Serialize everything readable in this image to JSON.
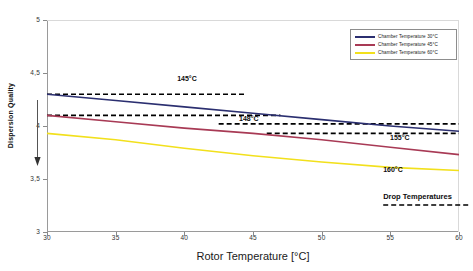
{
  "chart_data": {
    "type": "line",
    "title": "",
    "xlabel": "Rotor Temperature [°C]",
    "ylabel": "Dispersion Quality",
    "xlim": [
      30,
      60
    ],
    "ylim": [
      3,
      5
    ],
    "xticks": [
      "30",
      "35",
      "40",
      "45",
      "50",
      "55",
      "60"
    ],
    "yticks": [
      "5",
      "4,5",
      "4",
      "3,5",
      "3"
    ],
    "grid": false,
    "legend_position": "top-right",
    "series": [
      {
        "name": "Chamber Temperature 30°C",
        "color": "#2b2f70",
        "style": "solid",
        "x": [
          30,
          35,
          40,
          45,
          50,
          55,
          60
        ],
        "values": [
          4.3,
          4.24,
          4.18,
          4.12,
          4.06,
          4.0,
          3.95
        ]
      },
      {
        "name": "Chamber Temperature 45°C",
        "color": "#a83a55",
        "style": "solid",
        "x": [
          30,
          35,
          40,
          45,
          50,
          55,
          60
        ],
        "values": [
          4.1,
          4.04,
          3.98,
          3.93,
          3.87,
          3.8,
          3.73
        ]
      },
      {
        "name": "Chamber Temperature 60°C",
        "color": "#f2e01c",
        "style": "solid",
        "x": [
          30,
          35,
          40,
          45,
          50,
          55,
          60
        ],
        "values": [
          3.93,
          3.87,
          3.79,
          3.72,
          3.66,
          3.61,
          3.58
        ]
      }
    ],
    "reference_lines": [
      {
        "label": "145°C",
        "value": 4.3,
        "style": "dashed",
        "color": "#000000"
      },
      {
        "label": "148°C",
        "value": 4.1,
        "style": "dashed",
        "color": "#000000"
      },
      {
        "label": "155°C",
        "value": 4.02,
        "style": "dashed",
        "color": "#000000"
      },
      {
        "label": "160°C",
        "value": 3.93,
        "style": "dashed",
        "color": "#000000"
      }
    ],
    "annotations": [
      {
        "text": "145°C",
        "x": 40.5,
        "y": 4.43
      },
      {
        "text": "148°C",
        "x": 45.0,
        "y": 4.06
      },
      {
        "text": "155°C",
        "x": 56.0,
        "y": 3.88
      },
      {
        "text": "160°C",
        "x": 55.5,
        "y": 3.58
      },
      {
        "text": "Drop Temperatures",
        "x": 55.5,
        "y": 3.33
      }
    ]
  },
  "legend": {
    "items": [
      {
        "label": "Chamber Temperature 30°C",
        "color": "#2b2f70"
      },
      {
        "label": "Chamber Temperature 45°C",
        "color": "#a83a55"
      },
      {
        "label": "Chamber Temperature 60°C",
        "color": "#f2e01c"
      }
    ]
  },
  "axes": {
    "x_title": "Rotor Temperature [°C]",
    "y_title": "Dispersion Quality"
  }
}
